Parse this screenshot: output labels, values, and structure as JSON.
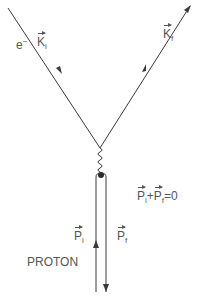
{
  "diagram": {
    "type": "feynman-diagram",
    "electron": {
      "label": "e",
      "charge": "−",
      "incoming_momentum": {
        "symbol": "K",
        "subscript": "i"
      },
      "outgoing_momentum": {
        "symbol": "K",
        "subscript": "f"
      }
    },
    "exchange": {
      "kind": "photon",
      "style": "wavy"
    },
    "proton": {
      "label": "PROTON",
      "incoming_momentum": {
        "symbol": "P",
        "subscript": "i"
      },
      "outgoing_momentum": {
        "symbol": "P",
        "subscript": "f"
      }
    },
    "equation": {
      "lhs_1": {
        "symbol": "P",
        "subscript": "i"
      },
      "operator": "+",
      "lhs_2": {
        "symbol": "P",
        "subscript": "f"
      },
      "equals": "=",
      "rhs": "0"
    },
    "colors": {
      "line": "#3a3a3a",
      "text": "#555555",
      "background": "#ffffff"
    }
  }
}
